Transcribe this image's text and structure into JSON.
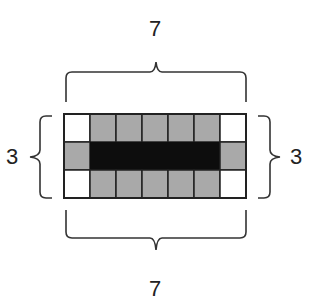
{
  "diagram": {
    "rows": 3,
    "cols": 7,
    "grid": [
      [
        "white",
        "gray",
        "gray",
        "gray",
        "gray",
        "gray",
        "white"
      ],
      [
        "gray",
        "black",
        "black",
        "black",
        "black",
        "black",
        "gray"
      ],
      [
        "white",
        "gray",
        "gray",
        "gray",
        "gray",
        "gray",
        "white"
      ]
    ],
    "colors": {
      "white": "#ffffff",
      "gray": "#a9a9a9",
      "black": "#0d0d0d",
      "stroke": "#222222"
    },
    "labels": {
      "top": "7",
      "bottom": "7",
      "left": "3",
      "right": "3"
    }
  }
}
